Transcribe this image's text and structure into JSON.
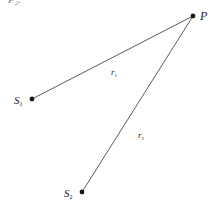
{
  "diagram": {
    "type": "geometry",
    "colors": {
      "line": "#4a4a4a",
      "point": "#1a1a1a",
      "text": "#222222",
      "background": "#ffffff"
    },
    "cropped_header_text": "P₂.",
    "points": [
      {
        "id": "P",
        "label": "P",
        "subscript": "",
        "x": 193,
        "y": 16
      },
      {
        "id": "S1",
        "label": "S",
        "subscript": "1",
        "x": 32,
        "y": 99
      },
      {
        "id": "S2",
        "label": "S",
        "subscript": "2",
        "x": 82,
        "y": 192
      }
    ],
    "segments": [
      {
        "from": "S1",
        "to": "P",
        "label": "r",
        "subscript": "1"
      },
      {
        "from": "S2",
        "to": "P",
        "label": "r",
        "subscript": "2"
      }
    ]
  }
}
